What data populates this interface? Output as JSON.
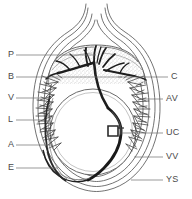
{
  "figure": {
    "type": "anatomical-line-drawing",
    "background_color": "#ffffff",
    "ink_color": "#3a3a3a",
    "stipple_color": "#9a9a9a",
    "leader_color": "#6e6e6e",
    "width": 192,
    "height": 199
  },
  "labels": {
    "left": [
      {
        "key": "P",
        "text": "P",
        "x": 8,
        "y": 50,
        "leader_to_x": 96,
        "leader_y": 55,
        "name": "label-p-placenta"
      },
      {
        "key": "B",
        "text": "B",
        "x": 8,
        "y": 72,
        "leader_to_x": 122,
        "leader_y": 77,
        "name": "label-b-blood-vessels"
      },
      {
        "key": "V",
        "text": "V",
        "x": 8,
        "y": 93,
        "leader_to_x": 50,
        "leader_y": 98,
        "name": "label-v-villi"
      },
      {
        "key": "L",
        "text": "L",
        "x": 8,
        "y": 115,
        "leader_to_x": 44,
        "leader_y": 120,
        "name": "label-l-lumen"
      },
      {
        "key": "A",
        "text": "A",
        "x": 8,
        "y": 140,
        "leader_to_x": 52,
        "leader_y": 145,
        "name": "label-a-allantois"
      },
      {
        "key": "E",
        "text": "E",
        "x": 8,
        "y": 163,
        "leader_to_x": 58,
        "leader_y": 168,
        "name": "label-e-endometrium"
      }
    ],
    "right": [
      {
        "key": "C",
        "text": "C",
        "x": 171,
        "y": 72,
        "leader_to_x": 118,
        "leader_y": 77,
        "name": "label-c-chorion"
      },
      {
        "key": "AV",
        "text": "AV",
        "x": 166,
        "y": 94,
        "leader_to_x": 144,
        "leader_y": 99,
        "name": "label-av-allantoic-vessels"
      },
      {
        "key": "UC",
        "text": "UC",
        "x": 166,
        "y": 128,
        "leader_to_x": 122,
        "leader_y": 133,
        "name": "label-uc-umbilical-cord"
      },
      {
        "key": "VV",
        "text": "VV",
        "x": 166,
        "y": 152,
        "leader_to_x": 134,
        "leader_y": 157,
        "name": "label-vv-vitelline-vessels"
      },
      {
        "key": "YS",
        "text": "YS",
        "x": 166,
        "y": 175,
        "leader_to_x": 131,
        "leader_y": 180,
        "name": "label-ys-yolk-sac"
      }
    ]
  }
}
